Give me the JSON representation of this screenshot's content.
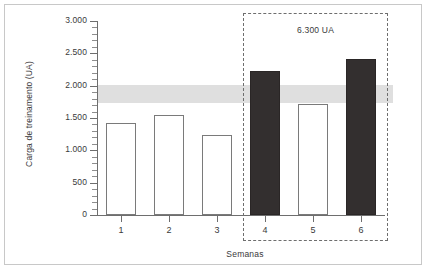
{
  "chart_data": {
    "type": "bar",
    "title": "",
    "subtitle": "",
    "xlabel": "Semanas",
    "ylabel": "Carga de treinamento (UA)",
    "categories": [
      "1",
      "2",
      "3",
      "4",
      "5",
      "6"
    ],
    "values": [
      1430,
      1540,
      1230,
      2230,
      1720,
      2420
    ],
    "series": [
      {
        "name": "Carga de treinamento",
        "values": [
          1430,
          1540,
          1230,
          2230,
          1720,
          2420
        ],
        "styles": [
          "light",
          "light",
          "light",
          "dark",
          "light",
          "dark"
        ]
      }
    ],
    "ylim": [
      0,
      3000
    ],
    "xlim": [
      0,
      6
    ],
    "y_major_ticks": [
      0,
      500,
      1000,
      1500,
      2000,
      2500,
      3000
    ],
    "y_tick_labels": [
      "0",
      "500",
      "1.000",
      "1.500",
      "2.000",
      "2.500",
      "3.000"
    ],
    "y_minor_tick_step": 100,
    "x_tick_labels": [
      "1",
      "2",
      "3",
      "4",
      "5",
      "6"
    ],
    "grid": false,
    "legend": false,
    "legend_position": "none",
    "bands": [
      {
        "name": "faixa-otima",
        "y_start": 1730,
        "y_end": 2010,
        "color": "#d9d9d9"
      }
    ],
    "annotations": [
      {
        "name": "overload-block",
        "text": "6.300 UA",
        "covers_categories": [
          "4",
          "5",
          "6"
        ],
        "style": "dashed-box"
      }
    ],
    "colors": {
      "bar_light_fill": "#ffffff",
      "bar_light_border": "#7a7a7a",
      "bar_dark_fill": "#332f2f",
      "band": "#d9d9d9",
      "axis": "#6e6e6e",
      "text": "#3a3a3a",
      "frame": "#c8c8c8",
      "background": "#ffffff"
    }
  }
}
